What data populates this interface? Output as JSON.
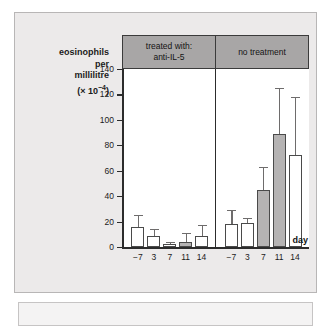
{
  "figure": {
    "y_axis_title_lines": [
      "eosinophils",
      "per",
      "millilitre"
    ],
    "y_axis_unit_prefix": "(× 10",
    "y_axis_unit_exponent": "−4",
    "y_axis_unit_suffix": ")",
    "x_axis_title": "day",
    "panels": [
      {
        "header_line1": "treated with:",
        "header_line2": "anti-IL-5"
      },
      {
        "header_line1": "no treatment",
        "header_line2": ""
      }
    ]
  },
  "chart_data": {
    "type": "bar",
    "title": "",
    "xlabel": "day",
    "ylabel": "eosinophils per millilitre (× 10−4)",
    "ylim": [
      0,
      140
    ],
    "yticks": [
      0,
      20,
      40,
      60,
      80,
      100,
      120,
      140
    ],
    "grid": false,
    "legend": "none",
    "categories": [
      "−7",
      "3",
      "7",
      "11",
      "14"
    ],
    "panels": [
      {
        "name": "treated with: anti-IL-5",
        "values": [
          16,
          9,
          2,
          4,
          9
        ],
        "error_upper": [
          25,
          14,
          4,
          11,
          17
        ],
        "fills": [
          "white",
          "white",
          "white",
          "grey",
          "white"
        ]
      },
      {
        "name": "no treatment",
        "values": [
          18,
          19,
          45,
          89,
          72
        ],
        "error_upper": [
          29,
          23,
          63,
          125,
          118
        ],
        "fills": [
          "white",
          "white",
          "grey",
          "grey",
          "white"
        ]
      }
    ],
    "colors": {
      "bar_white": "#ffffff",
      "bar_grey": "#b5b3b3",
      "axis": "#2c2c2c",
      "header": "#a8a6a6"
    }
  }
}
